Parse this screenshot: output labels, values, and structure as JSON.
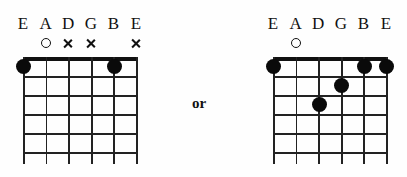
{
  "page": {
    "background_color": "#fefefe",
    "ink_color": "#111111"
  },
  "connector": {
    "label": "or"
  },
  "diagrams": [
    {
      "id": "chord-left",
      "string_labels": [
        "E",
        "A",
        "D",
        "G",
        "B",
        "E"
      ],
      "strings": 6,
      "frets": 5,
      "markers": [
        "none",
        "open",
        "muted",
        "muted",
        "none",
        "muted"
      ],
      "dots": [
        {
          "string": 1,
          "fret": 1
        },
        {
          "string": 5,
          "fret": 1
        }
      ]
    },
    {
      "id": "chord-right",
      "string_labels": [
        "E",
        "A",
        "D",
        "G",
        "B",
        "E"
      ],
      "strings": 6,
      "frets": 5,
      "markers": [
        "none",
        "open",
        "none",
        "none",
        "none",
        "none"
      ],
      "dots": [
        {
          "string": 1,
          "fret": 1
        },
        {
          "string": 5,
          "fret": 1
        },
        {
          "string": 6,
          "fret": 1
        },
        {
          "string": 4,
          "fret": 2
        },
        {
          "string": 3,
          "fret": 3
        }
      ]
    }
  ]
}
